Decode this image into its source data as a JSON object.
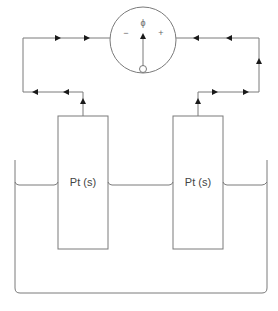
{
  "diagram": {
    "type": "electrochemical-cell",
    "voltmeter": {
      "symbol": "ϕ",
      "negative_label": "−",
      "positive_label": "+"
    },
    "electrodes": [
      {
        "label": "Pt (s)"
      },
      {
        "label": "Pt (s)"
      }
    ],
    "colors": {
      "line": "#7a7a7a",
      "arrow": "#1a1a1a",
      "background": "#ffffff"
    }
  }
}
